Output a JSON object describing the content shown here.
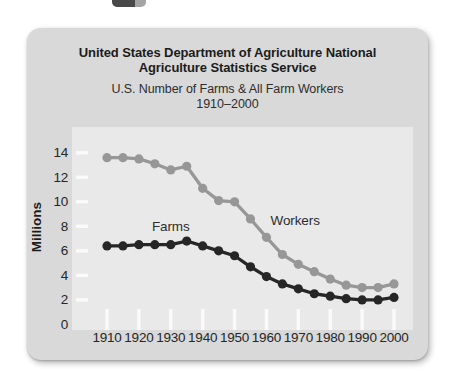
{
  "header": {
    "title": "United States Department of Agriculture National Agriculture Statistics Service",
    "subtitle": "U.S. Number of Farms & All Farm Workers",
    "subtitle_range": "1910–2000"
  },
  "colors": {
    "card_bg": "#d9d9d9",
    "plot_bg": "#e9e9e9",
    "tick": "#fafafa",
    "farms_line": "#262626",
    "workers_line": "#979797",
    "text": "#1c1c1c"
  },
  "chart_data": {
    "type": "line",
    "title": "United States Department of Agriculture National Agriculture Statistics Service",
    "subtitle": "U.S. Number of Farms & All Farm Workers 1910–2000",
    "xlabel": "",
    "ylabel": "Millions",
    "ylim": [
      0,
      14
    ],
    "grid": false,
    "legend_position": "inline-labels",
    "ytick_labels": [
      0,
      2,
      4,
      6,
      8,
      10,
      12,
      14
    ],
    "xticks": [
      1910,
      1920,
      1930,
      1940,
      1950,
      1960,
      1970,
      1980,
      1990,
      2000
    ],
    "x": [
      1910,
      1915,
      1920,
      1925,
      1930,
      1935,
      1940,
      1945,
      1950,
      1955,
      1960,
      1965,
      1970,
      1975,
      1980,
      1985,
      1990,
      1995,
      2000
    ],
    "series": [
      {
        "name": "Farms",
        "color": "#262626",
        "values": [
          6.4,
          6.4,
          6.5,
          6.5,
          6.5,
          6.8,
          6.4,
          6.0,
          5.6,
          4.7,
          3.9,
          3.3,
          2.9,
          2.5,
          2.3,
          2.1,
          2.0,
          2.0,
          2.2
        ],
        "label_at": {
          "x": 1930,
          "y": 8.0
        }
      },
      {
        "name": "Workers",
        "color": "#979797",
        "values": [
          13.6,
          13.6,
          13.5,
          13.1,
          12.6,
          12.9,
          11.1,
          10.1,
          10.0,
          8.6,
          7.1,
          5.7,
          4.9,
          4.3,
          3.7,
          3.2,
          3.0,
          3.0,
          3.3
        ],
        "label_at": {
          "x": 1969,
          "y": 8.5
        }
      }
    ]
  }
}
